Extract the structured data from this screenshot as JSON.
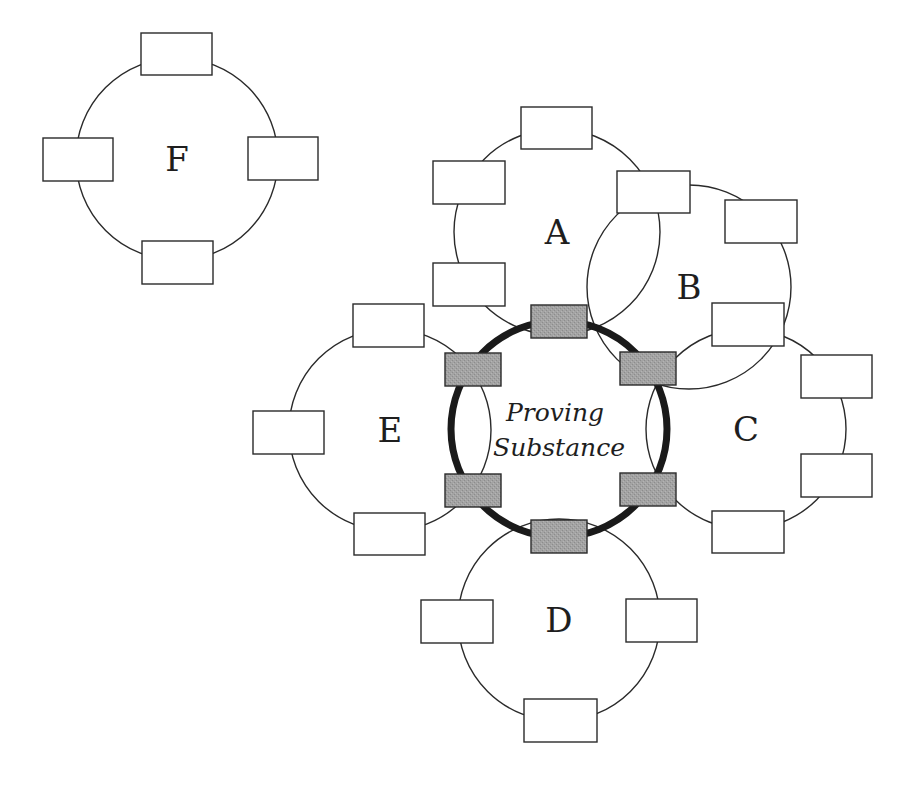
{
  "diagram": {
    "type": "cluster-diagram",
    "center": {
      "label_line1": "Proving",
      "label_line2": "Substance",
      "cx": 559,
      "cy": 429,
      "r": 108,
      "ports": [
        {
          "position": "top",
          "x": 531,
          "y": 305,
          "w": 56,
          "h": 33
        },
        {
          "position": "upper-left",
          "x": 445,
          "y": 353,
          "w": 56,
          "h": 33
        },
        {
          "position": "upper-right",
          "x": 620,
          "y": 352,
          "w": 56,
          "h": 33
        },
        {
          "position": "lower-left",
          "x": 445,
          "y": 474,
          "w": 56,
          "h": 33
        },
        {
          "position": "lower-right",
          "x": 620,
          "y": 473,
          "w": 56,
          "h": 33
        },
        {
          "position": "bottom",
          "x": 531,
          "y": 520,
          "w": 56,
          "h": 33
        }
      ]
    },
    "clusters": [
      {
        "id": "F",
        "label": "F",
        "cx": 177,
        "cy": 159,
        "r": 101,
        "boxes": [
          {
            "x": 141,
            "y": 33,
            "w": 71,
            "h": 42
          },
          {
            "x": 43,
            "y": 138,
            "w": 70,
            "h": 43
          },
          {
            "x": 248,
            "y": 137,
            "w": 70,
            "h": 43
          },
          {
            "x": 142,
            "y": 241,
            "w": 71,
            "h": 43
          }
        ]
      },
      {
        "id": "A",
        "label": "A",
        "cx": 557,
        "cy": 232,
        "r": 103,
        "boxes": [
          {
            "x": 521,
            "y": 107,
            "w": 71,
            "h": 42
          },
          {
            "x": 433,
            "y": 161,
            "w": 72,
            "h": 43
          },
          {
            "x": 433,
            "y": 263,
            "w": 72,
            "h": 43
          }
        ]
      },
      {
        "id": "B",
        "label": "B",
        "cx": 689,
        "cy": 287,
        "r": 102,
        "boxes": [
          {
            "x": 617,
            "y": 171,
            "w": 73,
            "h": 42
          },
          {
            "x": 725,
            "y": 200,
            "w": 72,
            "h": 43
          },
          {
            "x": 712,
            "y": 303,
            "w": 72,
            "h": 43
          }
        ]
      },
      {
        "id": "C",
        "label": "C",
        "cx": 746,
        "cy": 429,
        "r": 100,
        "boxes": [
          {
            "x": 801,
            "y": 355,
            "w": 71,
            "h": 43
          },
          {
            "x": 801,
            "y": 454,
            "w": 71,
            "h": 43
          },
          {
            "x": 712,
            "y": 511,
            "w": 72,
            "h": 42
          }
        ]
      },
      {
        "id": "D",
        "label": "D",
        "cx": 559,
        "cy": 620,
        "r": 101,
        "boxes": [
          {
            "x": 421,
            "y": 600,
            "w": 72,
            "h": 43
          },
          {
            "x": 626,
            "y": 599,
            "w": 71,
            "h": 43
          },
          {
            "x": 524,
            "y": 699,
            "w": 73,
            "h": 43
          }
        ]
      },
      {
        "id": "E",
        "label": "E",
        "cx": 390,
        "cy": 430,
        "r": 101,
        "boxes": [
          {
            "x": 353,
            "y": 304,
            "w": 71,
            "h": 43
          },
          {
            "x": 253,
            "y": 411,
            "w": 71,
            "h": 43
          },
          {
            "x": 354,
            "y": 513,
            "w": 71,
            "h": 42
          }
        ]
      }
    ],
    "colors": {
      "line": "#2a2a2a",
      "core_ring": "#1a1a1a",
      "port_fill": "#9f9f9f",
      "box_fill": "#ffffff",
      "background": "#ffffff"
    }
  }
}
